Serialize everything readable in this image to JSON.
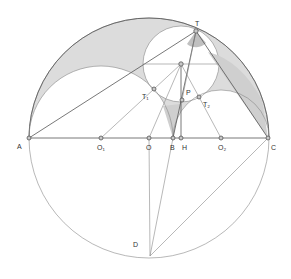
{
  "diagram": {
    "colors": {
      "shade": "#dcdcdc",
      "dark_shade": "#c8c8c8",
      "line": "#555555",
      "light_line": "#888888"
    },
    "points": [
      {
        "id": "A",
        "label": "A",
        "x": 29,
        "y": 138,
        "lx": 17,
        "ly": 149
      },
      {
        "id": "O1",
        "label": "O₁",
        "x": 101,
        "y": 138,
        "lx": 97,
        "ly": 150
      },
      {
        "id": "O",
        "label": "O",
        "x": 149,
        "y": 138,
        "lx": 146,
        "ly": 150
      },
      {
        "id": "B",
        "label": "B",
        "x": 173,
        "y": 138,
        "lx": 170,
        "ly": 150
      },
      {
        "id": "H",
        "label": "H",
        "x": 181,
        "y": 138,
        "lx": 182,
        "ly": 150
      },
      {
        "id": "O2",
        "label": "O₂",
        "x": 221,
        "y": 138,
        "lx": 218,
        "ly": 150
      },
      {
        "id": "C",
        "label": "C",
        "x": 268,
        "y": 138,
        "lx": 271,
        "ly": 150
      },
      {
        "id": "T",
        "label": "T",
        "x": 196,
        "y": 31,
        "lx": 195,
        "ly": 26
      },
      {
        "id": "P",
        "label": "P",
        "x": 182,
        "y": 100,
        "lx": 186,
        "ly": 95
      },
      {
        "id": "Q",
        "label": "",
        "x": 181,
        "y": 64,
        "lx": 0,
        "ly": 0
      },
      {
        "id": "T1",
        "label": "T₁",
        "x": 154,
        "y": 89,
        "lx": 142,
        "ly": 99
      },
      {
        "id": "T2",
        "label": "T₂",
        "x": 199,
        "y": 97,
        "lx": 203,
        "ly": 107
      },
      {
        "id": "D",
        "label": "D",
        "x": 150,
        "y": 256,
        "lx": 133,
        "ly": 247
      }
    ]
  }
}
